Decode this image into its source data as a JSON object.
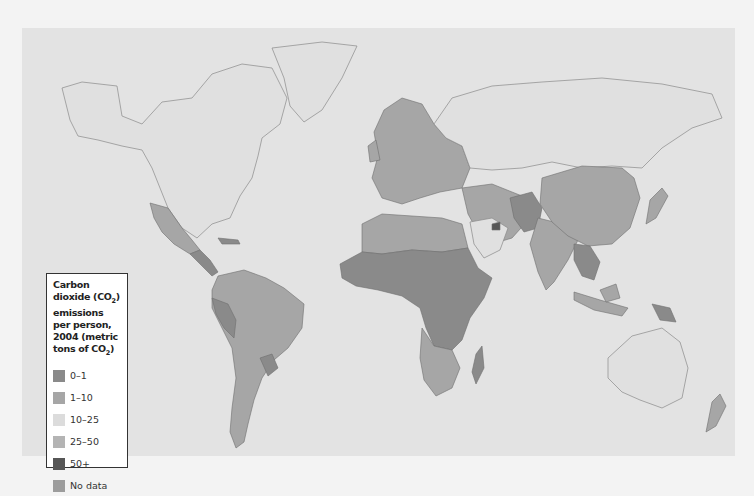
{
  "map": {
    "title_lines": [
      "Carbon dioxide (CO",
      "2",
      ")",
      "emissions per person,",
      "2004",
      "(metric tons of CO",
      "2",
      ")"
    ],
    "legend": {
      "title_part1": "Carbon dioxide (CO",
      "title_sub1": "2",
      "title_part2": ") emissions per person, 2004 (metric tons of CO",
      "title_sub2": "2",
      "title_part3": ")",
      "items": [
        {
          "label": "0–1",
          "color": "#8a8a8a"
        },
        {
          "label": "1–10",
          "color": "#a6a6a6"
        },
        {
          "label": "10–25",
          "color": "#dcdcdc"
        },
        {
          "label": "25–50",
          "color": "#b4b4b4"
        },
        {
          "label": "50+",
          "color": "#565656"
        },
        {
          "label": "No data",
          "color": "#9c9c9c"
        }
      ]
    },
    "colors": {
      "page_background": "#f3f3f3",
      "ocean": "#e3e3e3",
      "border": "#6e6e6e"
    },
    "regions": [
      {
        "name": "North America (USA, Canada)",
        "category": "10–25"
      },
      {
        "name": "Mexico",
        "category": "1–10"
      },
      {
        "name": "Central America",
        "category": "0–1"
      },
      {
        "name": "South America",
        "category": "1–10"
      },
      {
        "name": "Peru",
        "category": "0–1"
      },
      {
        "name": "Paraguay",
        "category": "0–1"
      },
      {
        "name": "Europe",
        "category": "1–10"
      },
      {
        "name": "North Africa",
        "category": "1–10"
      },
      {
        "name": "Sub-Saharan Africa",
        "category": "0–1"
      },
      {
        "name": "Southern Africa",
        "category": "1–10"
      },
      {
        "name": "Madagascar",
        "category": "0–1"
      },
      {
        "name": "Middle East",
        "category": "1–10"
      },
      {
        "name": "United Arab Emirates",
        "category": "50+"
      },
      {
        "name": "Russia",
        "category": "10–25"
      },
      {
        "name": "China & Mongolia",
        "category": "1–10"
      },
      {
        "name": "India",
        "category": "1–10"
      },
      {
        "name": "Pakistan/Afghanistan",
        "category": "0–1"
      },
      {
        "name": "Southeast Asia",
        "category": "1–10"
      },
      {
        "name": "Japan",
        "category": "1–10"
      },
      {
        "name": "Indonesia",
        "category": "1–10"
      },
      {
        "name": "Papua New Guinea",
        "category": "0–1"
      },
      {
        "name": "Australia",
        "category": "10–25"
      },
      {
        "name": "New Zealand",
        "category": "1–10"
      },
      {
        "name": "Greenland",
        "category": "10–25"
      }
    ]
  }
}
